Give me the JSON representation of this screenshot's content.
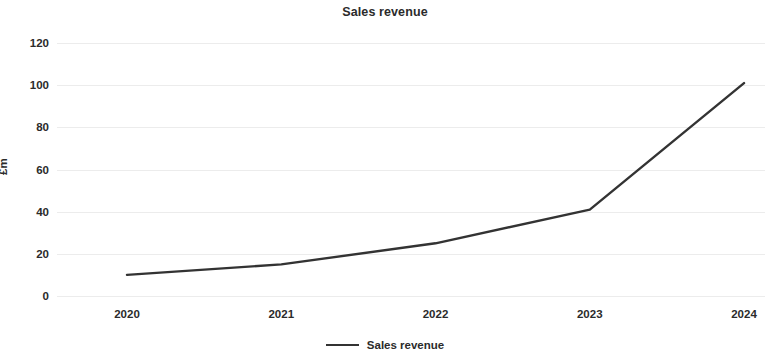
{
  "chart_data": {
    "type": "line",
    "title": "Sales revenue",
    "xlabel": "",
    "ylabel": "£m",
    "x": [
      "2020",
      "2021",
      "2022",
      "2023",
      "2024"
    ],
    "categories": [
      "2020",
      "2021",
      "2022",
      "2023",
      "2024"
    ],
    "series": [
      {
        "name": "Sales revenue",
        "values": [
          10,
          15,
          25,
          41,
          101
        ],
        "color": "#333333"
      }
    ],
    "values": [
      10,
      15,
      25,
      41,
      101
    ],
    "ylim": [
      0,
      120
    ],
    "yticks": [
      0,
      20,
      40,
      60,
      80,
      100,
      120
    ],
    "ytick_labels": [
      "0",
      "20",
      "40",
      "60",
      "80",
      "100",
      "120"
    ],
    "xtick_labels": [
      "2020",
      "2021",
      "2022",
      "2023",
      "2024"
    ],
    "grid": true,
    "grid_axis": "y",
    "grid_color": "#ececec",
    "legend": [
      "Sales revenue"
    ],
    "legend_position": "bottom-center",
    "background_color": "#ffffff",
    "text_color": "#2b2b2b"
  }
}
